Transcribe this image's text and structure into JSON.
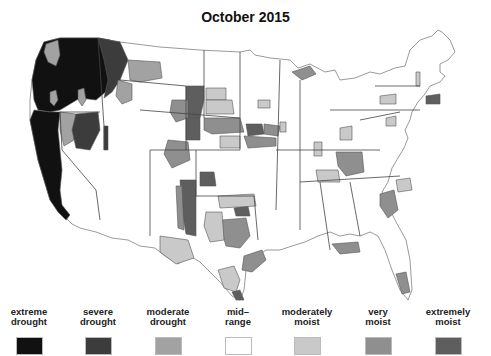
{
  "title": "October 2015",
  "colors": {
    "extreme_drought": "#111111",
    "severe_drought": "#3c3c3c",
    "moderate_drought": "#a2a2a2",
    "mid_range": "#ffffff",
    "moderately_moist": "#c9c9c9",
    "very_moist": "#8f8f8f",
    "extremely_moist": "#5e5e5e",
    "borders": "#555555"
  },
  "legend": {
    "items": [
      {
        "label_line1": "extreme",
        "label_line2": "drought",
        "color": "#111111"
      },
      {
        "label_line1": "severe",
        "label_line2": "drought",
        "color": "#3c3c3c"
      },
      {
        "label_line1": "moderate",
        "label_line2": "drought",
        "color": "#a2a2a2"
      },
      {
        "label_line1": "mid–",
        "label_line2": "range",
        "color": "#ffffff"
      },
      {
        "label_line1": "moderately",
        "label_line2": "moist",
        "color": "#c9c9c9"
      },
      {
        "label_line1": "very",
        "label_line2": "moist",
        "color": "#8f8f8f"
      },
      {
        "label_line1": "extremely",
        "label_line2": "moist",
        "color": "#5e5e5e"
      }
    ]
  },
  "map": {
    "description": "US climate division drought severity map, October 2015",
    "regions_summary": [
      {
        "area": "Washington / Oregon / Idaho / N. California",
        "category": "extreme drought"
      },
      {
        "area": "California coast",
        "category": "extreme drought"
      },
      {
        "area": "Nevada / W. Montana",
        "category": "severe drought"
      },
      {
        "area": "E. Montana / Wyoming patches",
        "category": "moderate drought"
      },
      {
        "area": "Wyoming / Nebraska / Iowa / New Mexico / Oklahoma",
        "category": "extremely moist"
      },
      {
        "area": "Texas / Arkansas / S. Carolina / Kentucky",
        "category": "very moist"
      },
      {
        "area": "Colorado / Kansas / Texas / Florida",
        "category": "moderately moist"
      }
    ]
  }
}
